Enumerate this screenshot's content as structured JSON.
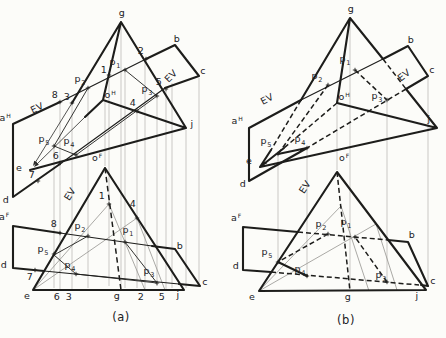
{
  "figure": {
    "background": "#fcfcf9",
    "ink": "#1d1d1b",
    "projection_color": "#b4b3af",
    "construction_color": "#8f8e8a",
    "captions": {
      "a": "(a)",
      "b": "(b)"
    },
    "labels": {
      "a": [
        {
          "t": "g",
          "x": 122,
          "y": 13
        },
        {
          "t": "b",
          "x": 177,
          "y": 39
        },
        {
          "t": "c",
          "x": 203,
          "y": 71
        },
        {
          "t": "j",
          "x": 192,
          "y": 124
        },
        {
          "t": "e",
          "x": 19,
          "y": 168
        },
        {
          "t": "a",
          "sup": "H",
          "x": 5,
          "y": 118
        },
        {
          "t": "d",
          "x": 6,
          "y": 200
        },
        {
          "t": "o",
          "sup": "H",
          "x": 110,
          "y": 95
        },
        {
          "t": "EV",
          "x": 37,
          "y": 108,
          "rot": -26
        },
        {
          "t": "EV",
          "x": 171,
          "y": 76,
          "rot": -45
        },
        {
          "t": "8",
          "x": 55,
          "y": 95
        },
        {
          "t": "3",
          "x": 67,
          "y": 97
        },
        {
          "t": "p",
          "sub": "2",
          "x": 80,
          "y": 79
        },
        {
          "t": "p",
          "sub": "1",
          "x": 115,
          "y": 62
        },
        {
          "t": "1",
          "x": 104,
          "y": 70
        },
        {
          "t": "2",
          "x": 141,
          "y": 51
        },
        {
          "t": "5",
          "x": 159,
          "y": 82
        },
        {
          "t": "p",
          "sub": "3",
          "x": 147,
          "y": 89
        },
        {
          "t": "4",
          "x": 133,
          "y": 103
        },
        {
          "t": "p",
          "sub": "5",
          "x": 44,
          "y": 139
        },
        {
          "t": "p",
          "sub": "4",
          "x": 69,
          "y": 141
        },
        {
          "t": "6",
          "x": 56,
          "y": 156
        },
        {
          "t": "7",
          "x": 32,
          "y": 175
        },
        {
          "t": "o",
          "sup": "F",
          "x": 97,
          "y": 158
        },
        {
          "t": "a",
          "sup": "F",
          "x": 4,
          "y": 217
        },
        {
          "t": "d",
          "x": 4,
          "y": 265
        },
        {
          "t": "b",
          "x": 180,
          "y": 246
        },
        {
          "t": "c",
          "x": 205,
          "y": 282
        },
        {
          "t": "EV",
          "x": 70,
          "y": 194,
          "rot": -58
        },
        {
          "t": "8",
          "x": 54,
          "y": 224
        },
        {
          "t": "p",
          "sub": "2",
          "x": 80,
          "y": 226
        },
        {
          "t": "p",
          "sub": "1",
          "x": 128,
          "y": 230
        },
        {
          "t": "1",
          "x": 102,
          "y": 196
        },
        {
          "t": "4",
          "x": 133,
          "y": 204
        },
        {
          "t": "p",
          "sub": "5",
          "x": 43,
          "y": 249
        },
        {
          "t": "p",
          "sub": "4",
          "x": 70,
          "y": 265
        },
        {
          "t": "p",
          "sub": "3",
          "x": 149,
          "y": 271
        },
        {
          "t": "7",
          "x": 30,
          "y": 277
        },
        {
          "t": "e",
          "x": 27,
          "y": 296
        },
        {
          "t": "6",
          "x": 57,
          "y": 297
        },
        {
          "t": "3",
          "x": 69,
          "y": 297
        },
        {
          "t": "g",
          "x": 117,
          "y": 296
        },
        {
          "t": "2",
          "x": 141,
          "y": 297
        },
        {
          "t": "5",
          "x": 162,
          "y": 297
        },
        {
          "t": "j",
          "x": 178,
          "y": 295
        }
      ],
      "b": [
        {
          "t": "g",
          "x": 351,
          "y": 9
        },
        {
          "t": "b",
          "x": 411,
          "y": 40
        },
        {
          "t": "c",
          "x": 432,
          "y": 70
        },
        {
          "t": "j",
          "x": 429,
          "y": 119
        },
        {
          "t": "e",
          "x": 249,
          "y": 161
        },
        {
          "t": "a",
          "sup": "H",
          "x": 237,
          "y": 121
        },
        {
          "t": "d",
          "x": 243,
          "y": 184
        },
        {
          "t": "o",
          "sup": "H",
          "x": 344,
          "y": 97
        },
        {
          "t": "EV",
          "x": 267,
          "y": 99,
          "rot": -28
        },
        {
          "t": "EV",
          "x": 404,
          "y": 75,
          "rot": -38
        },
        {
          "t": "p",
          "sub": "1",
          "x": 345,
          "y": 59
        },
        {
          "t": "p",
          "sub": "2",
          "x": 317,
          "y": 76
        },
        {
          "t": "p",
          "sub": "3",
          "x": 377,
          "y": 96
        },
        {
          "t": "p",
          "sub": "5",
          "x": 266,
          "y": 141
        },
        {
          "t": "p",
          "sub": "4",
          "x": 300,
          "y": 139
        },
        {
          "t": "o",
          "sup": "F",
          "x": 344,
          "y": 158
        },
        {
          "t": "a",
          "sup": "F",
          "x": 236,
          "y": 218
        },
        {
          "t": "d",
          "x": 236,
          "y": 266
        },
        {
          "t": "b",
          "x": 412,
          "y": 235
        },
        {
          "t": "c",
          "x": 433,
          "y": 281
        },
        {
          "t": "EV",
          "x": 305,
          "y": 187,
          "rot": -57
        },
        {
          "t": "p",
          "sub": "2",
          "x": 321,
          "y": 224
        },
        {
          "t": "p",
          "sub": "1",
          "x": 346,
          "y": 222
        },
        {
          "t": "p",
          "sub": "5",
          "x": 267,
          "y": 252
        },
        {
          "t": "p",
          "sub": "4",
          "x": 300,
          "y": 269
        },
        {
          "t": "p",
          "sub": "3",
          "x": 381,
          "y": 275
        },
        {
          "t": "e",
          "x": 252,
          "y": 297
        },
        {
          "t": "g",
          "x": 348,
          "y": 297
        },
        {
          "t": "j",
          "x": 417,
          "y": 296
        }
      ]
    }
  }
}
